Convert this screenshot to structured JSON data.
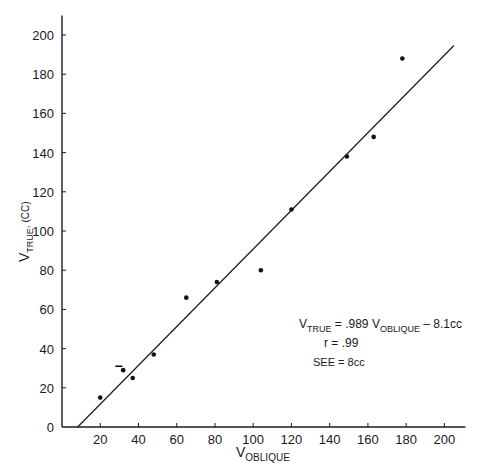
{
  "chart_data": {
    "type": "scatter",
    "title": "",
    "xlabel": {
      "main": "V",
      "sub": "OBLIQUE"
    },
    "ylabel": {
      "main": "V",
      "sub": "TRUE",
      "unit": ", (CC)"
    },
    "xlim": [
      0,
      211
    ],
    "ylim": [
      0,
      210
    ],
    "x_ticks": [
      20,
      40,
      60,
      80,
      100,
      120,
      140,
      160,
      180,
      200
    ],
    "y_ticks": [
      0,
      20,
      40,
      60,
      80,
      100,
      120,
      140,
      160,
      180,
      200
    ],
    "origin_label": "0",
    "grid": false,
    "legend": null,
    "series": [
      {
        "name": "measurements",
        "points": [
          [
            20,
            15
          ],
          [
            32,
            29
          ],
          [
            37,
            25
          ],
          [
            48,
            37
          ],
          [
            65,
            66
          ],
          [
            81,
            74
          ],
          [
            104,
            80
          ],
          [
            120,
            111
          ],
          [
            149,
            138
          ],
          [
            163,
            148
          ],
          [
            178,
            188
          ]
        ]
      }
    ],
    "regression_line": {
      "slope": 0.989,
      "intercept": -8.1,
      "x_start": 8.2,
      "x_end": 205
    },
    "extra_marks": [
      {
        "type": "dash",
        "x": 30,
        "y": 31
      }
    ],
    "annotations": {
      "equation": {
        "lhs_main": "V",
        "lhs_sub": "TRUE",
        "mid": " = .989 ",
        "rhs_main": "V",
        "rhs_sub": "OBLIQUE",
        "tail": " – 8.1cc"
      },
      "r": "r = .99",
      "see": "SEE = 8cc"
    }
  }
}
